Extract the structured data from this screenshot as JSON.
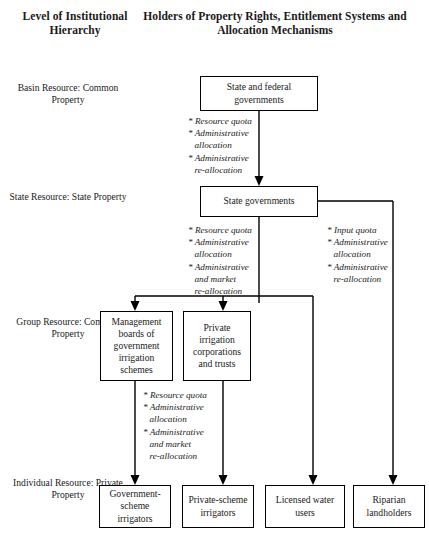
{
  "headers": {
    "left_column": "Level of Institutional Hierarchy",
    "main_column": "Holders of Property Rights, Entitlement Systems and Allocation Mechanisms"
  },
  "tiers": [
    {
      "id": "basin",
      "label": "Basin Resource: Common Property"
    },
    {
      "id": "state",
      "label": "State Resource: State Property"
    },
    {
      "id": "group",
      "label": "Group Resource: Common Property"
    },
    {
      "id": "individual",
      "label": "Individual Resource: Private Property"
    }
  ],
  "nodes": [
    {
      "id": "state-federal-governments",
      "label": "State and federal governments"
    },
    {
      "id": "state-governments",
      "label": "State governments"
    },
    {
      "id": "management-boards",
      "label": "Management boards of government irrigation schemes"
    },
    {
      "id": "private-irrigation",
      "label": "Private irrigation corporations and trusts"
    },
    {
      "id": "government-scheme-irrigators",
      "label": "Government-scheme irrigators"
    },
    {
      "id": "private-scheme-irrigators",
      "label": "Private-scheme irrigators"
    },
    {
      "id": "licensed-water-users",
      "label": "Licensed water users"
    },
    {
      "id": "riparian-landholders",
      "label": "Riparian landholders"
    }
  ],
  "mechanism_groups": [
    {
      "id": "basin-to-state",
      "items": [
        {
          "text": "* Resource quota",
          "sub": false
        },
        {
          "text": "* Administrative",
          "sub": false
        },
        {
          "text": "allocation",
          "sub": true
        },
        {
          "text": "* Administrative",
          "sub": false
        },
        {
          "text": "re-allocation",
          "sub": true
        }
      ]
    },
    {
      "id": "state-to-group",
      "items": [
        {
          "text": "* Resource quota",
          "sub": false
        },
        {
          "text": "* Administrative",
          "sub": false
        },
        {
          "text": "allocation",
          "sub": true
        },
        {
          "text": "* Administrative",
          "sub": false
        },
        {
          "text": "and market",
          "sub": true
        },
        {
          "text": "re-allocation",
          "sub": true
        }
      ]
    },
    {
      "id": "state-to-individual-right",
      "items": [
        {
          "text": "* Input quota",
          "sub": false
        },
        {
          "text": "* Administrative",
          "sub": false
        },
        {
          "text": "allocation",
          "sub": true
        },
        {
          "text": "* Administrative",
          "sub": false
        },
        {
          "text": "re-allocation",
          "sub": true
        }
      ]
    },
    {
      "id": "group-to-individual",
      "items": [
        {
          "text": "* Resource quota",
          "sub": false
        },
        {
          "text": "* Administrative",
          "sub": false
        },
        {
          "text": "allocation",
          "sub": true
        },
        {
          "text": "* Administrative",
          "sub": false
        },
        {
          "text": "and market",
          "sub": true
        },
        {
          "text": "re-allocation",
          "sub": true
        }
      ]
    }
  ],
  "colors": {
    "line": "#000000",
    "box_border": "#000000",
    "background": "#ffffff",
    "text": "#1a1a1a"
  }
}
